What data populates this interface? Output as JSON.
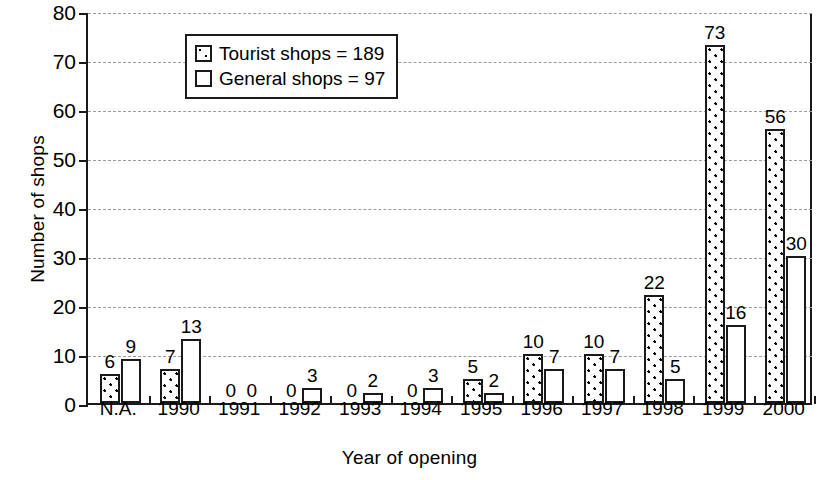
{
  "chart_data": {
    "type": "bar",
    "title": "",
    "xlabel": "Year of opening",
    "ylabel": "Number of shops",
    "ylim": [
      0,
      80
    ],
    "ytick_step": 10,
    "yticks": [
      "0",
      "10",
      "20",
      "30",
      "40",
      "50",
      "60",
      "70",
      "80"
    ],
    "grid": "horizontal dashed gray",
    "legend_position": "top-left inside plot",
    "categories": [
      "N.A.",
      "1990",
      "1991",
      "1992",
      "1993",
      "1994",
      "1995",
      "1996",
      "1997",
      "1998",
      "1999",
      "2000"
    ],
    "series": [
      {
        "name": "Tourist shops = 189",
        "short_name": "Tourist shops",
        "total": 189,
        "fill": "dotted",
        "values": [
          6,
          7,
          0,
          0,
          0,
          0,
          5,
          10,
          10,
          22,
          73,
          56
        ]
      },
      {
        "name": "General shops = 97",
        "short_name": "General shops",
        "total": 97,
        "fill": "white",
        "values": [
          9,
          13,
          0,
          3,
          2,
          3,
          2,
          7,
          7,
          5,
          16,
          30
        ]
      }
    ],
    "value_labels": [
      [
        "6",
        "9"
      ],
      [
        "7",
        "13"
      ],
      [
        "0",
        "0"
      ],
      [
        "0",
        "3"
      ],
      [
        "0",
        "2"
      ],
      [
        "0",
        "3"
      ],
      [
        "5",
        "2"
      ],
      [
        "10",
        "7"
      ],
      [
        "10",
        "7"
      ],
      [
        "22",
        "5"
      ],
      [
        "73",
        "16"
      ],
      [
        "56",
        "30"
      ]
    ]
  },
  "colors": {
    "ink": "#1a1a1a",
    "grid": "#9a9a9a",
    "background": "#ffffff"
  }
}
